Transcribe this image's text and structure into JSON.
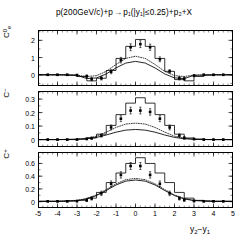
{
  "figure": {
    "title_parts": {
      "beam": "p(200GeV/c)+p",
      "arrow": "→",
      "products": "p₁(|y₁|≤0.25)+p₂+X"
    },
    "title_full": "p(200GeV/c)+p → p₁(|y₁|≤0.25)+p₂+X",
    "xaxis_title": "y₂−y₁"
  },
  "chart_data": [
    {
      "type": "line",
      "panel": "top",
      "ylabel": "C⁰ₑ",
      "xlabel": "y₂−y₁",
      "title": "p(200GeV/c)+p → p₁(|y₁|≤0.25)+p₂+X",
      "xlim": [
        -5,
        5
      ],
      "ylim": [
        -0.65,
        2.6
      ],
      "ytick_values": [
        0,
        1,
        2
      ],
      "ytick_labels": [
        "0",
        "1",
        "2"
      ],
      "xtick_values": [
        -5,
        -4,
        -3,
        -2,
        -1,
        0,
        1,
        2,
        3,
        4,
        5
      ],
      "xtick_labels": [
        "-5",
        "-4",
        "-3",
        "-2",
        "-1",
        "0",
        "1",
        "2",
        "3",
        "4",
        "5"
      ],
      "grid": false,
      "legend": "none",
      "series": [
        {
          "name": "data-points",
          "style": "markers",
          "x": [
            -4.5,
            -4.0,
            -3.5,
            -3.0,
            -2.5,
            -2.25,
            -1.75,
            -1.25,
            -0.75,
            -0.25,
            0.25,
            0.75,
            1.25,
            1.75,
            2.25,
            2.5,
            3.0,
            3.5,
            4.0,
            4.5
          ],
          "y": [
            0.0,
            0.0,
            0.0,
            -0.02,
            -0.08,
            -0.25,
            -0.2,
            0.18,
            0.85,
            1.6,
            1.78,
            1.6,
            0.9,
            0.2,
            -0.2,
            -0.22,
            -0.05,
            0.0,
            0.0,
            0.0
          ],
          "yerr": [
            0.04,
            0.04,
            0.04,
            0.05,
            0.07,
            0.1,
            0.1,
            0.12,
            0.16,
            0.2,
            0.2,
            0.18,
            0.14,
            0.1,
            0.1,
            0.09,
            0.06,
            0.04,
            0.04,
            0.04
          ]
        },
        {
          "name": "histogram-model",
          "style": "step-solid",
          "x": [
            -5,
            -4.5,
            -4,
            -3.5,
            -3,
            -2.5,
            -2,
            -1.5,
            -1,
            -0.5,
            0,
            0.5,
            1,
            1.5,
            2,
            2.5,
            3,
            3.5,
            4,
            4.5,
            5
          ],
          "y": [
            0.0,
            0.0,
            0.0,
            -0.02,
            -0.1,
            -0.35,
            -0.2,
            0.25,
            0.95,
            1.65,
            2.05,
            1.65,
            0.95,
            0.2,
            -0.28,
            -0.35,
            -0.1,
            -0.02,
            0.0,
            0.0,
            0.0
          ]
        },
        {
          "name": "dotted-curve",
          "style": "dotted",
          "x": [
            -5,
            -4,
            -3,
            -2.5,
            -2,
            -1.5,
            -1,
            -0.5,
            0,
            0.5,
            1,
            1.5,
            2,
            2.5,
            3,
            4,
            5
          ],
          "y": [
            0.0,
            0.0,
            -0.02,
            -0.1,
            -0.05,
            0.2,
            0.6,
            0.95,
            1.08,
            0.95,
            0.6,
            0.2,
            -0.05,
            -0.1,
            -0.02,
            0.0,
            0.0
          ]
        },
        {
          "name": "solid-curve",
          "style": "solid",
          "x": [
            -5,
            -4,
            -3,
            -2.5,
            -2,
            -1.5,
            -1,
            -0.5,
            0,
            0.5,
            1,
            1.5,
            2,
            2.5,
            3,
            4,
            5
          ],
          "y": [
            0.0,
            0.0,
            -0.03,
            -0.22,
            -0.18,
            0.05,
            0.4,
            0.68,
            0.78,
            0.68,
            0.4,
            0.05,
            -0.18,
            -0.22,
            -0.03,
            0.0,
            0.0
          ]
        }
      ]
    },
    {
      "type": "line",
      "panel": "middle",
      "ylabel": "C⁻",
      "xlabel": "y₂−y₁",
      "xlim": [
        -5,
        5
      ],
      "ylim": [
        -0.055,
        0.36
      ],
      "ytick_values": [
        0,
        0.1,
        0.2,
        0.3
      ],
      "ytick_labels": [
        "0",
        "0.1",
        "0.2",
        "0.3"
      ],
      "xtick_values": [
        -5,
        -4,
        -3,
        -2,
        -1,
        0,
        1,
        2,
        3,
        4,
        5
      ],
      "xtick_labels": [
        "-5",
        "-4",
        "-3",
        "-2",
        "-1",
        "0",
        "1",
        "2",
        "3",
        "4",
        "5"
      ],
      "grid": false,
      "legend": "none",
      "series": [
        {
          "name": "data-points",
          "style": "markers",
          "x": [
            -4.5,
            -4.0,
            -3.5,
            -3.0,
            -2.5,
            -2.25,
            -1.75,
            -1.25,
            -0.75,
            -0.25,
            0.25,
            0.75,
            1.25,
            1.75,
            2.25,
            2.5,
            3.0,
            3.5,
            4.0,
            4.5
          ],
          "y": [
            0.0,
            0.0,
            0.0,
            0.0,
            0.005,
            0.01,
            0.03,
            0.09,
            0.155,
            0.215,
            0.215,
            0.205,
            0.155,
            0.09,
            0.03,
            0.012,
            0.004,
            0.0,
            0.0,
            0.0
          ],
          "yerr": [
            0.004,
            0.004,
            0.004,
            0.005,
            0.006,
            0.008,
            0.012,
            0.018,
            0.022,
            0.025,
            0.025,
            0.024,
            0.022,
            0.018,
            0.012,
            0.009,
            0.006,
            0.004,
            0.004,
            0.004
          ]
        },
        {
          "name": "histogram-model",
          "style": "step-solid",
          "x": [
            -5,
            -4.5,
            -4,
            -3.5,
            -3,
            -2.5,
            -2,
            -1.5,
            -1,
            -0.5,
            0,
            0.5,
            1,
            1.5,
            2,
            2.5,
            3,
            3.5,
            4,
            4.5,
            5
          ],
          "y": [
            0.0,
            0.0,
            0.0,
            0.0,
            0.003,
            0.012,
            0.04,
            0.105,
            0.185,
            0.27,
            0.31,
            0.27,
            0.185,
            0.105,
            0.04,
            0.012,
            0.003,
            0.0,
            0.0,
            0.0,
            0.0
          ]
        },
        {
          "name": "dotted-curve",
          "style": "dotted",
          "x": [
            -5,
            -4,
            -3,
            -2.5,
            -2,
            -1.5,
            -1,
            -0.5,
            0,
            0.5,
            1,
            1.5,
            2,
            2.5,
            3,
            4,
            5
          ],
          "y": [
            0.0,
            0.0,
            0.003,
            0.01,
            0.025,
            0.055,
            0.09,
            0.115,
            0.122,
            0.115,
            0.09,
            0.055,
            0.025,
            0.01,
            0.003,
            0.0,
            0.0
          ]
        },
        {
          "name": "solid-curve",
          "style": "solid",
          "x": [
            -5,
            -4,
            -3,
            -2.5,
            -2,
            -1.5,
            -1,
            -0.5,
            0,
            0.5,
            1,
            1.5,
            2,
            2.5,
            3,
            4,
            5
          ],
          "y": [
            0.0,
            0.0,
            0.002,
            0.006,
            0.016,
            0.034,
            0.055,
            0.07,
            0.075,
            0.07,
            0.055,
            0.034,
            0.016,
            0.006,
            0.002,
            0.0,
            0.0
          ]
        }
      ]
    },
    {
      "type": "line",
      "panel": "bottom",
      "ylabel": "C⁺",
      "xlabel": "y₂−y₁",
      "xlim": [
        -5,
        5
      ],
      "ylim": [
        -0.1,
        0.78
      ],
      "ytick_values": [
        0,
        0.2,
        0.4,
        0.6
      ],
      "ytick_labels": [
        "0",
        "0.2",
        "0.4",
        "0.6"
      ],
      "xtick_values": [
        -5,
        -4,
        -3,
        -2,
        -1,
        0,
        1,
        2,
        3,
        4,
        5
      ],
      "xtick_labels": [
        "-5",
        "-4",
        "-3",
        "-2",
        "-1",
        "0",
        "1",
        "2",
        "3",
        "4",
        "5"
      ],
      "grid": false,
      "legend": "none",
      "series": [
        {
          "name": "data-points",
          "style": "markers",
          "x": [
            -4.5,
            -4.0,
            -3.5,
            -3.0,
            -2.5,
            -2.25,
            -1.75,
            -1.25,
            -0.75,
            -0.25,
            0.25,
            0.75,
            1.25,
            1.75,
            2.25,
            2.5,
            3.0,
            3.5,
            4.0,
            4.5
          ],
          "y": [
            0.005,
            0.005,
            0.005,
            0.008,
            0.02,
            0.05,
            0.13,
            0.28,
            0.42,
            0.56,
            0.56,
            0.42,
            0.28,
            0.13,
            0.05,
            0.025,
            0.01,
            0.005,
            0.005,
            0.005
          ],
          "yerr": [
            0.01,
            0.01,
            0.01,
            0.012,
            0.018,
            0.025,
            0.035,
            0.045,
            0.05,
            0.055,
            0.055,
            0.05,
            0.045,
            0.035,
            0.025,
            0.02,
            0.014,
            0.01,
            0.01,
            0.01
          ]
        },
        {
          "name": "histogram-model",
          "style": "step-solid",
          "x": [
            -5,
            -4.5,
            -4,
            -3.5,
            -3,
            -2.5,
            -2,
            -1.5,
            -1,
            -0.5,
            0,
            0.5,
            1,
            1.5,
            2,
            2.5,
            3,
            3.5,
            4,
            4.5,
            5
          ],
          "y": [
            0.005,
            0.005,
            0.005,
            0.008,
            0.02,
            0.055,
            0.145,
            0.3,
            0.45,
            0.6,
            0.69,
            0.6,
            0.45,
            0.3,
            0.145,
            0.055,
            0.02,
            0.008,
            0.005,
            0.005,
            0.005
          ]
        },
        {
          "name": "dotted-curve",
          "style": "dotted",
          "x": [
            -5,
            -4,
            -3,
            -2.5,
            -2,
            -1.5,
            -1,
            -0.5,
            0,
            0.5,
            1,
            1.5,
            2,
            2.5,
            3,
            4,
            5
          ],
          "y": [
            0.005,
            0.006,
            0.02,
            0.05,
            0.105,
            0.19,
            0.28,
            0.345,
            0.365,
            0.345,
            0.28,
            0.19,
            0.105,
            0.05,
            0.02,
            0.006,
            0.005
          ]
        },
        {
          "name": "solid-curve",
          "style": "solid",
          "x": [
            -5,
            -4,
            -3,
            -2.5,
            -2,
            -1.5,
            -1,
            -0.5,
            0,
            0.5,
            1,
            1.5,
            2,
            2.5,
            3,
            4,
            5
          ],
          "y": [
            0.004,
            0.005,
            0.016,
            0.042,
            0.095,
            0.175,
            0.262,
            0.322,
            0.34,
            0.322,
            0.262,
            0.175,
            0.095,
            0.042,
            0.016,
            0.005,
            0.004
          ]
        }
      ]
    }
  ],
  "style": {
    "line_color": "#000000",
    "marker_color": "#000000",
    "background": "#ffffff"
  }
}
